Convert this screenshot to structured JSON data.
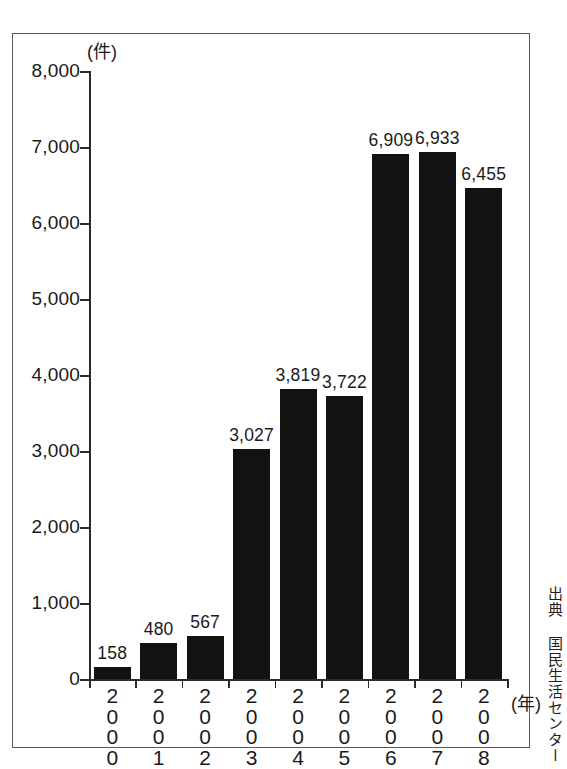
{
  "chart_data": {
    "type": "bar",
    "title": "",
    "xlabel": "(年)",
    "ylabel": "(件)",
    "categories": [
      "2000",
      "2001",
      "2002",
      "2003",
      "2004",
      "2005",
      "2006",
      "2007",
      "2008"
    ],
    "values": [
      158,
      480,
      567,
      3027,
      3819,
      3722,
      6909,
      6933,
      6455
    ],
    "value_labels": [
      "158",
      "480",
      "567",
      "3,027",
      "3,819",
      "3,722",
      "6,909",
      "6,933",
      "6,455"
    ],
    "ylim": [
      0,
      8000
    ],
    "ytick_values": [
      0,
      1000,
      2000,
      3000,
      4000,
      5000,
      6000,
      7000,
      8000
    ],
    "ytick_labels": [
      "0",
      "1,000",
      "2,000",
      "3,000",
      "4,000",
      "5,000",
      "6,000",
      "7,000",
      "8,000"
    ],
    "grid": false,
    "legend": "none",
    "bar_color": "#121212",
    "axis_color": "#2b2b2b"
  },
  "figure": {
    "unit_y_label": "(件)",
    "unit_x_label": "(年)",
    "source_credit": "出典 国民生活センター",
    "frame_color": "#5a5a5a"
  }
}
